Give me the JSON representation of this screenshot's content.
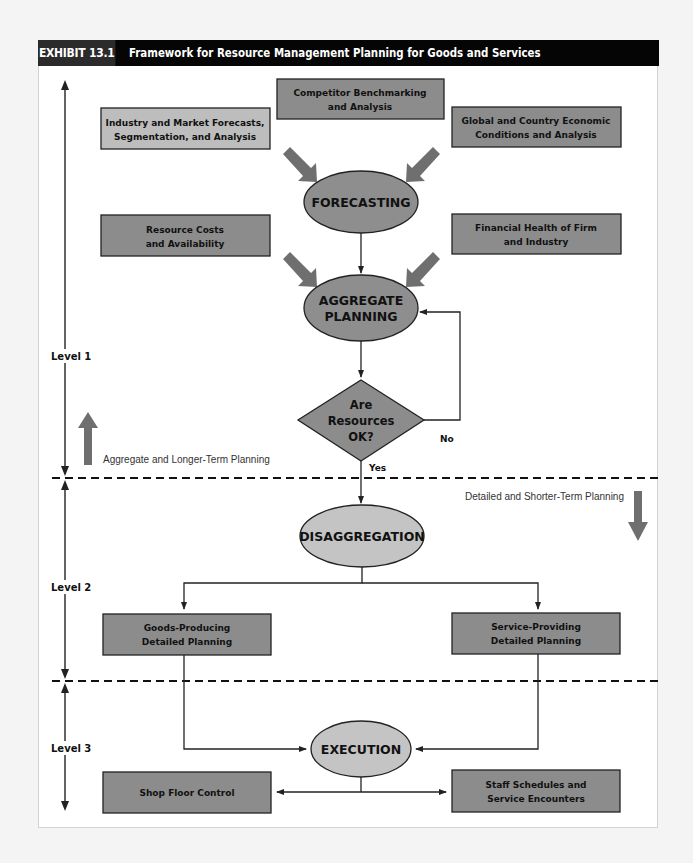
{
  "header": {
    "exhibit_label": "EXHIBIT 13.1",
    "title": "Framework for Resource Management Planning for Goods and Services"
  },
  "colors": {
    "header_bg": "#050505",
    "header_label_bg": "#2b2b2b",
    "box_dark": "#8c8c8c",
    "box_light": "#bdbdbd",
    "ellipse_dark": "#8e8e8e",
    "ellipse_light": "#c4c4c4",
    "arrow_fat": "#6f6f6f",
    "line": "#222222"
  },
  "inputs": {
    "competitor": {
      "line1": "Competitor Benchmarking",
      "line2": "and Analysis"
    },
    "industry": {
      "line1": "Industry and Market Forecasts,",
      "line2": "Segmentation, and Analysis"
    },
    "global": {
      "line1": "Global and Country Economic",
      "line2": "Conditions and Analysis"
    },
    "resource_costs": {
      "line1": "Resource Costs",
      "line2": "and Availability"
    },
    "financial_health": {
      "line1": "Financial Health of Firm",
      "line2": "and Industry"
    }
  },
  "process": {
    "forecasting": "FORECASTING",
    "aggregate_line1": "AGGREGATE",
    "aggregate_line2": "PLANNING",
    "decision_line1": "Are",
    "decision_line2": "Resources",
    "decision_line3": "OK?",
    "decision_no": "No",
    "decision_yes": "Yes",
    "disaggregation": "DISAGGREGATION",
    "execution": "EXECUTION"
  },
  "detailed": {
    "goods": {
      "line1": "Goods-Producing",
      "line2": "Detailed Planning"
    },
    "service": {
      "line1": "Service-Providing",
      "line2": "Detailed Planning"
    },
    "shop_floor": "Shop Floor Control",
    "staff": {
      "line1": "Staff Schedules and",
      "line2": "Service Encounters"
    }
  },
  "levels": {
    "level1": "Level 1",
    "level2": "Level 2",
    "level3": "Level 3"
  },
  "annotations": {
    "aggregate_longer": "Aggregate and Longer-Term Planning",
    "detailed_shorter": "Detailed and Shorter-Term Planning"
  }
}
